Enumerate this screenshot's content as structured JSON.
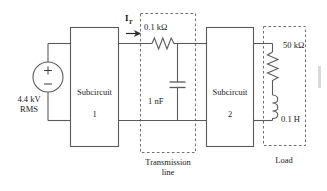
{
  "diagram": {
    "stroke_color": "#5a5a5a",
    "dash_color": "#6e6e6e",
    "text_color": "#1a1a1a",
    "source": {
      "symbol": "ac-voltage-source",
      "plus_sign": "+",
      "minus_sign": "−",
      "label_line1": "4.4 kV",
      "label_line2": "RMS"
    },
    "blocks": [
      {
        "name": "subcircuit-1",
        "label_line1": "Subcircuit",
        "label_line2": "1"
      },
      {
        "name": "subcircuit-2",
        "label_line1": "Subcircuit",
        "label_line2": "2"
      }
    ],
    "current": {
      "symbol": "I",
      "subscript": "T",
      "arrow": "current-arrow-right"
    },
    "transmission_line": {
      "group_label_line1": "Transmission",
      "group_label_line2": "line",
      "resistor": {
        "name": "series-resistor",
        "value": "0.1 kΩ"
      },
      "capacitor": {
        "name": "shunt-capacitor",
        "value": "1 nF"
      }
    },
    "load": {
      "group_label": "Load",
      "resistor": {
        "name": "load-resistor",
        "value": "50 kΩ"
      },
      "inductor": {
        "name": "load-inductor",
        "value": "0.1 H"
      }
    }
  }
}
